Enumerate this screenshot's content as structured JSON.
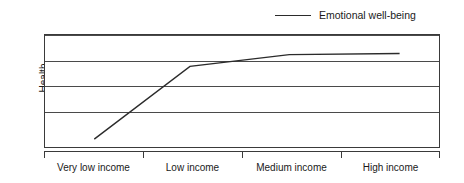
{
  "chart_data": {
    "type": "line",
    "title": "",
    "xlabel": "",
    "ylabel": "Health",
    "categories": [
      "Very low income",
      "Low income",
      "Medium income",
      "High income"
    ],
    "series": [
      {
        "name": "Emotional well-being",
        "color": "#2b2b2b",
        "values": [
          0.12,
          0.72,
          0.88,
          0.89
        ]
      }
    ],
    "ylim": [
      0,
      1
    ],
    "yticks": [
      0,
      0.25,
      0.5,
      0.75,
      1
    ],
    "ytick_labels": [
      "",
      "",
      "",
      "",
      ""
    ],
    "grid": "horizontal",
    "legend_position": "top-right",
    "points": [
      {
        "x": 0.125,
        "y": 0.07
      },
      {
        "x": 0.368,
        "y": 0.72
      },
      {
        "x": 0.62,
        "y": 0.825
      },
      {
        "x": 0.9,
        "y": 0.835
      }
    ]
  },
  "legend": {
    "entries": [
      {
        "label": "Emotional well-being",
        "swatch": "line-swatch",
        "color": "#2b2b2b"
      }
    ]
  },
  "axes": {
    "y_title": "Health",
    "x_tick_labels": [
      "Very low income",
      "Low income",
      "Medium income",
      "High income"
    ],
    "x_tick_positions": [
      0,
      25,
      50,
      75,
      100
    ],
    "x_label_positions": [
      12.5,
      37.5,
      62.5,
      87.5
    ],
    "gridline_positions": [
      0,
      25,
      50,
      75,
      100
    ]
  },
  "colors": {
    "background": "#ffffff",
    "frame": "#3a3a3a",
    "gridline": "#4a4a4a",
    "series": "#2b2b2b",
    "text": "#1a1a1a"
  }
}
